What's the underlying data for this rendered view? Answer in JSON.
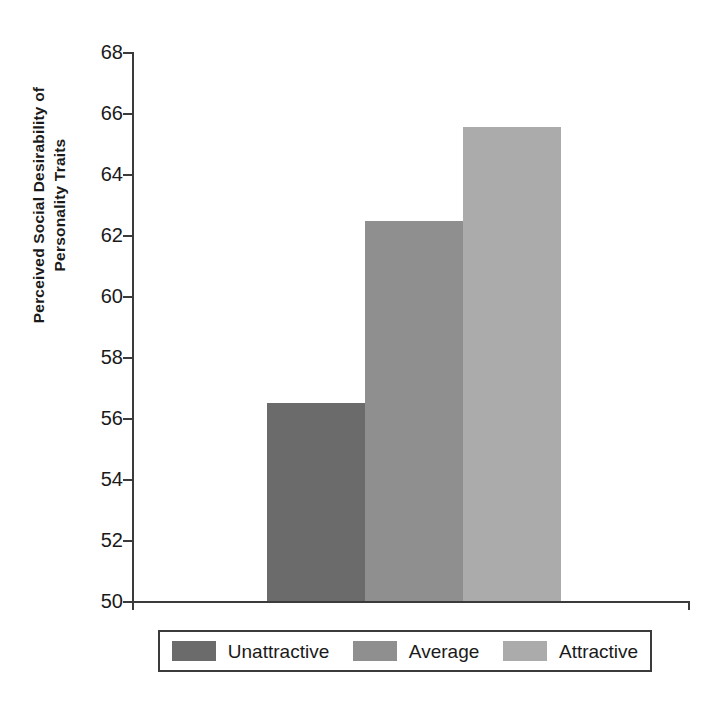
{
  "chart_data": {
    "type": "bar",
    "title": "",
    "xlabel": "",
    "ylabel_line1": "Perceived Social Desirability of",
    "ylabel_line2": "Personality Traits",
    "categories": [
      "Unattractive",
      "Average",
      "Attractive"
    ],
    "values": [
      56.5,
      62.45,
      65.55
    ],
    "ylim": [
      50,
      68
    ],
    "yticks": [
      50,
      52,
      54,
      56,
      58,
      60,
      62,
      64,
      66,
      68
    ],
    "ytick_labels": [
      "50",
      "52",
      "54",
      "56",
      "58",
      "60",
      "62",
      "64",
      "66",
      "68"
    ],
    "grid": false,
    "legend_position": "bottom",
    "legend": [
      {
        "label": "Unattractive",
        "color": "#6b6b6b"
      },
      {
        "label": "Average",
        "color": "#8f8f8f"
      },
      {
        "label": "Attractive",
        "color": "#ababab"
      }
    ],
    "series": [
      {
        "name": "Perceived Social Desirability of Personality Traits",
        "values": [
          56.5,
          62.45,
          65.55
        ],
        "colors": [
          "#6b6b6b",
          "#8f8f8f",
          "#ababab"
        ]
      }
    ],
    "axis_color": "#3b3b3b"
  }
}
